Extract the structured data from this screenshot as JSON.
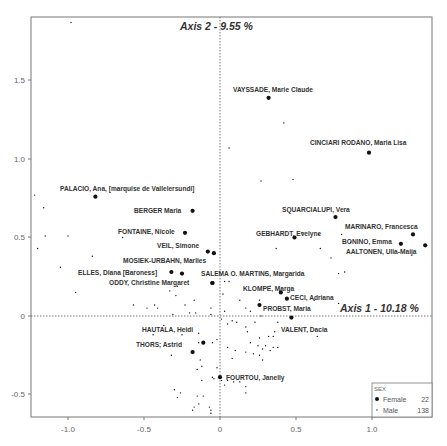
{
  "chart_data": {
    "type": "scatter",
    "title": "",
    "xlabel": "Axis 1 - 10.18 %",
    "ylabel": "Axis 2 - 9.55 %",
    "xlim": [
      -1.25,
      1.38
    ],
    "ylim": [
      -0.64,
      1.91
    ],
    "x_ticks": [
      -1.0,
      -0.5,
      0,
      0.5,
      1.0
    ],
    "x_tick_labels": [
      "-1.0",
      "-0.5",
      "0",
      "0.5",
      "1.0"
    ],
    "y_ticks": [
      -0.5,
      0,
      0.5,
      1.0,
      1.5
    ],
    "y_tick_labels": [
      "-0.5",
      "0",
      "0.5",
      "1.0",
      "1.5"
    ],
    "grid": false,
    "reference_lines": {
      "x0": true,
      "y0": true,
      "style": "dotted"
    },
    "legend": {
      "title": "SEX",
      "position": "bottom-right",
      "entries": [
        {
          "label": "Female",
          "count": "22",
          "marker": "large-dot"
        },
        {
          "label": "Male",
          "count": "138",
          "marker": "small-dot"
        }
      ]
    },
    "series": [
      {
        "name": "Female",
        "points": [
          {
            "label": "VAYSSADE, Marie Claude",
            "x": 0.32,
            "y": 1.39
          },
          {
            "label": "CINCIARI RODANO, Maria Lisa",
            "x": 0.98,
            "y": 1.04
          },
          {
            "label": "PALACIO, Ana, [marquise de Vallelersundi]",
            "x": -0.82,
            "y": 0.76
          },
          {
            "label": "BERGER Maria",
            "x": -0.18,
            "y": 0.67
          },
          {
            "label": "SQUARCIALUPI, Vera",
            "x": 0.76,
            "y": 0.63
          },
          {
            "label": "FONTAINE, Nicole",
            "x": -0.23,
            "y": 0.53
          },
          {
            "label": "GEBHARDT, Evelyne",
            "x": 0.49,
            "y": 0.5
          },
          {
            "label": "MARINARO, Francesca",
            "x": 1.27,
            "y": 0.52
          },
          {
            "label": "BONINO, Emma",
            "x": 1.19,
            "y": 0.46
          },
          {
            "label": "AALTONEN, Ulla-Maija",
            "x": 1.35,
            "y": 0.45
          },
          {
            "label": "VEIL, Simone",
            "x": -0.08,
            "y": 0.41
          },
          {
            "label": "MOSIEK-URBAHN, Marlies",
            "x": -0.04,
            "y": 0.4
          },
          {
            "label": "ELLES, Diana [Baroness]",
            "x": -0.32,
            "y": 0.28
          },
          {
            "label": "",
            "x": -0.25,
            "y": 0.27
          },
          {
            "label": "ODDY, Christine Margaret",
            "x": -0.05,
            "y": 0.21
          },
          {
            "label": "SALEMA O. MARTINS, Margarida",
            "x": -0.05,
            "y": 0.21
          },
          {
            "label": "KLOMPE, Marga",
            "x": 0.4,
            "y": 0.15
          },
          {
            "label": "CECI, Adriana",
            "x": 0.44,
            "y": 0.11
          },
          {
            "label": "PROBST, Maria",
            "x": 0.26,
            "y": 0.07
          },
          {
            "label": "VALENT, Dacia",
            "x": 0.47,
            "y": -0.01
          },
          {
            "label": "HAUTALA, Heidi",
            "x": -0.11,
            "y": -0.17
          },
          {
            "label": "THORS; Astrid",
            "x": -0.18,
            "y": -0.23
          },
          {
            "label": "FOURTOU, Janelly",
            "x": 0.0,
            "y": -0.39
          }
        ]
      },
      {
        "name": "Male",
        "points": [
          {
            "x": -0.98,
            "y": 1.87
          },
          {
            "x": 0.42,
            "y": 1.23
          },
          {
            "x": 0.06,
            "y": 1.07
          },
          {
            "x": -1.22,
            "y": 0.77
          },
          {
            "x": 0.27,
            "y": 0.86
          },
          {
            "x": 0.48,
            "y": 0.87
          },
          {
            "x": -1.16,
            "y": 0.69
          },
          {
            "x": -1.15,
            "y": 0.51
          },
          {
            "x": -1.0,
            "y": 0.51
          },
          {
            "x": -1.2,
            "y": 0.43
          },
          {
            "x": -0.84,
            "y": 0.38
          },
          {
            "x": -1.05,
            "y": 0.31
          },
          {
            "x": -0.95,
            "y": 0.15
          },
          {
            "x": -0.64,
            "y": 0.5
          },
          {
            "x": -0.57,
            "y": 0.07
          },
          {
            "x": -0.48,
            "y": 0.05
          },
          {
            "x": -0.41,
            "y": 0.05
          },
          {
            "x": -0.33,
            "y": 0.16
          },
          {
            "x": -0.29,
            "y": 0.13
          },
          {
            "x": -0.28,
            "y": 0.19
          },
          {
            "x": -0.23,
            "y": 0.07
          },
          {
            "x": -0.2,
            "y": 0.02
          },
          {
            "x": -0.16,
            "y": 0.02
          },
          {
            "x": -0.17,
            "y": 0.1
          },
          {
            "x": -0.31,
            "y": 0.01
          },
          {
            "x": -0.44,
            "y": -0.12
          },
          {
            "x": -0.32,
            "y": -0.25
          },
          {
            "x": -0.25,
            "y": -0.12
          },
          {
            "x": -0.14,
            "y": -0.11
          },
          {
            "x": -0.14,
            "y": -0.17
          },
          {
            "x": -0.05,
            "y": -0.17
          },
          {
            "x": -0.02,
            "y": -0.15
          },
          {
            "x": -0.13,
            "y": -0.28
          },
          {
            "x": -0.12,
            "y": -0.32
          },
          {
            "x": -0.15,
            "y": -0.34
          },
          {
            "x": -0.04,
            "y": -0.4
          },
          {
            "x": -0.05,
            "y": -0.39
          },
          {
            "x": -0.02,
            "y": -0.33
          },
          {
            "x": -0.12,
            "y": -0.41
          },
          {
            "x": -0.3,
            "y": -0.47
          },
          {
            "x": -0.28,
            "y": -0.52
          },
          {
            "x": -0.26,
            "y": -0.49
          },
          {
            "x": -0.15,
            "y": -0.51
          },
          {
            "x": -0.11,
            "y": -0.51
          },
          {
            "x": -0.14,
            "y": -0.56
          },
          {
            "x": -0.17,
            "y": -0.58
          },
          {
            "x": -0.18,
            "y": -0.6
          },
          {
            "x": -0.07,
            "y": -0.58
          },
          {
            "x": -0.06,
            "y": -0.6
          },
          {
            "x": -0.06,
            "y": -0.62
          },
          {
            "x": 0.01,
            "y": -0.41
          },
          {
            "x": 0.05,
            "y": -0.41
          },
          {
            "x": 0.03,
            "y": -0.44
          },
          {
            "x": 0.09,
            "y": -0.42
          },
          {
            "x": 0.13,
            "y": -0.42
          },
          {
            "x": 0.17,
            "y": -0.45
          },
          {
            "x": 0.17,
            "y": -0.49
          },
          {
            "x": 0.08,
            "y": -0.27
          },
          {
            "x": 0.05,
            "y": -0.2
          },
          {
            "x": 0.1,
            "y": -0.22
          },
          {
            "x": 0.17,
            "y": -0.23
          },
          {
            "x": 0.2,
            "y": -0.17
          },
          {
            "x": 0.22,
            "y": -0.24
          },
          {
            "x": 0.25,
            "y": -0.19
          },
          {
            "x": 0.28,
            "y": -0.21
          },
          {
            "x": 0.3,
            "y": -0.19
          },
          {
            "x": 0.33,
            "y": -0.22
          },
          {
            "x": 0.35,
            "y": -0.2
          },
          {
            "x": 0.26,
            "y": -0.25
          },
          {
            "x": 0.28,
            "y": -0.28
          },
          {
            "x": 0.38,
            "y": -0.2
          },
          {
            "x": 0.05,
            "y": -0.05
          },
          {
            "x": 0.08,
            "y": -0.03
          },
          {
            "x": 0.11,
            "y": -0.04
          },
          {
            "x": 0.17,
            "y": -0.07
          },
          {
            "x": 0.18,
            "y": -0.1
          },
          {
            "x": 0.23,
            "y": -0.04
          },
          {
            "x": 0.26,
            "y": -0.14
          },
          {
            "x": 0.32,
            "y": -0.13
          },
          {
            "x": 0.35,
            "y": -0.13
          },
          {
            "x": 0.36,
            "y": -0.1
          },
          {
            "x": 0.64,
            "y": -0.13
          },
          {
            "x": 0.38,
            "y": -0.04
          },
          {
            "x": 0.27,
            "y": 0.0
          },
          {
            "x": 0.26,
            "y": 0.1
          },
          {
            "x": 0.2,
            "y": 0.03
          },
          {
            "x": 0.17,
            "y": 0.05
          },
          {
            "x": 0.13,
            "y": 0.1
          },
          {
            "x": 0.33,
            "y": 0.19
          },
          {
            "x": 0.3,
            "y": 0.27
          },
          {
            "x": 0.73,
            "y": 0.37
          },
          {
            "x": 0.78,
            "y": 0.27
          },
          {
            "x": 0.82,
            "y": 0.28
          },
          {
            "x": 0.66,
            "y": 0.43
          },
          {
            "x": 0.8,
            "y": 0.52
          },
          {
            "x": 0.86,
            "y": 0.47
          },
          {
            "x": 0.54,
            "y": 0.53
          },
          {
            "x": 0.65,
            "y": 0.52
          },
          {
            "x": 0.37,
            "y": 0.43
          },
          {
            "x": 0.03,
            "y": 0.22
          },
          {
            "x": 0.06,
            "y": 0.22
          },
          {
            "x": 0.02,
            "y": 0.14
          },
          {
            "x": 0.03,
            "y": 0.03
          },
          {
            "x": 0.01,
            "y": -0.02
          },
          {
            "x": -0.06,
            "y": 0.05
          },
          {
            "x": -0.06,
            "y": 0.01
          },
          {
            "x": 0.78,
            "y": 0.08
          },
          {
            "x": 0.62,
            "y": 0.1
          },
          {
            "x": -0.37,
            "y": -0.06
          },
          {
            "x": -0.43,
            "y": 0.07
          }
        ]
      }
    ]
  },
  "labels": {
    "axis1_title": "Axis 1 - 10.18 %",
    "axis2_title": "Axis 2 - 9.55 %",
    "legend_title": "SEX",
    "legend_female": "Female",
    "legend_female_count": "22",
    "legend_male": "Male",
    "legend_male_count": "138",
    "x_ticks": [
      "-1.0",
      "-0.5",
      "0",
      "0.5",
      "1.0"
    ],
    "y_ticks": [
      "1.5",
      "1.0",
      "0.5",
      "0",
      "-0.5"
    ]
  }
}
